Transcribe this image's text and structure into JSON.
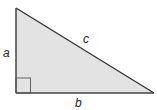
{
  "diagram": {
    "labels": {
      "a": "a",
      "b": "b",
      "c": "c"
    },
    "colors": {
      "fill": "#e3e3e3",
      "stroke": "#333333"
    }
  }
}
